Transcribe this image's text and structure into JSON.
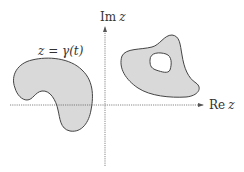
{
  "figure": {
    "type": "complex-plane-regions",
    "axes": {
      "real_axis_label_prefix": "Re",
      "real_axis_label_var": "z",
      "imag_axis_label_prefix": "Im",
      "imag_axis_label_var": "z"
    },
    "curve_label": {
      "lhs": "z",
      "eq": " = ",
      "rhs": "γ(t)"
    },
    "regions": [
      {
        "name": "left-region",
        "description": "simply connected kidney-shaped region crossing the real axis"
      },
      {
        "name": "right-region",
        "description": "region with a hole in the first quadrant"
      }
    ],
    "colors": {
      "fill": "#d9d9d9",
      "stroke": "#444444",
      "axis": "#555555",
      "hole": "#ffffff"
    }
  }
}
